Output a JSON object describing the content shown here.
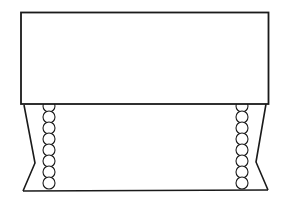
{
  "diagram": {
    "colors": {
      "line": "#1a1a1a",
      "fill": "#ffffff"
    },
    "parts": {
      "top_panel": {
        "label": ""
      },
      "base": {
        "label": ""
      },
      "left_bead_chain": {
        "bead_count": 8
      },
      "right_bead_chain": {
        "bead_count": 8
      }
    }
  }
}
